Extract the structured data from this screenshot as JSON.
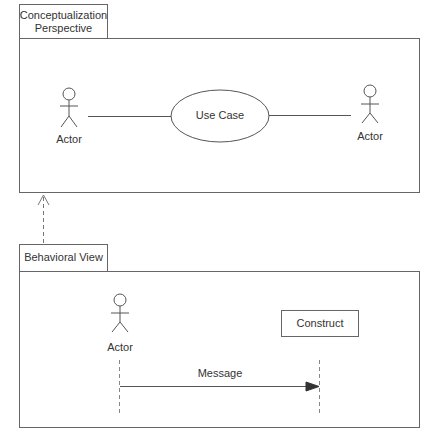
{
  "top_package": {
    "tab_label_line1": "Conceptualization",
    "tab_label_line2": "Perspective",
    "left_actor_label": "Actor",
    "use_case_label": "Use Case",
    "right_actor_label": "Actor"
  },
  "bottom_package": {
    "tab_label": "Behavioral View",
    "actor_label": "Actor",
    "construct_label": "Construct",
    "message_label": "Message"
  },
  "relationship": {
    "type": "dependency",
    "from": "Behavioral View",
    "to": "Conceptualization Perspective"
  }
}
